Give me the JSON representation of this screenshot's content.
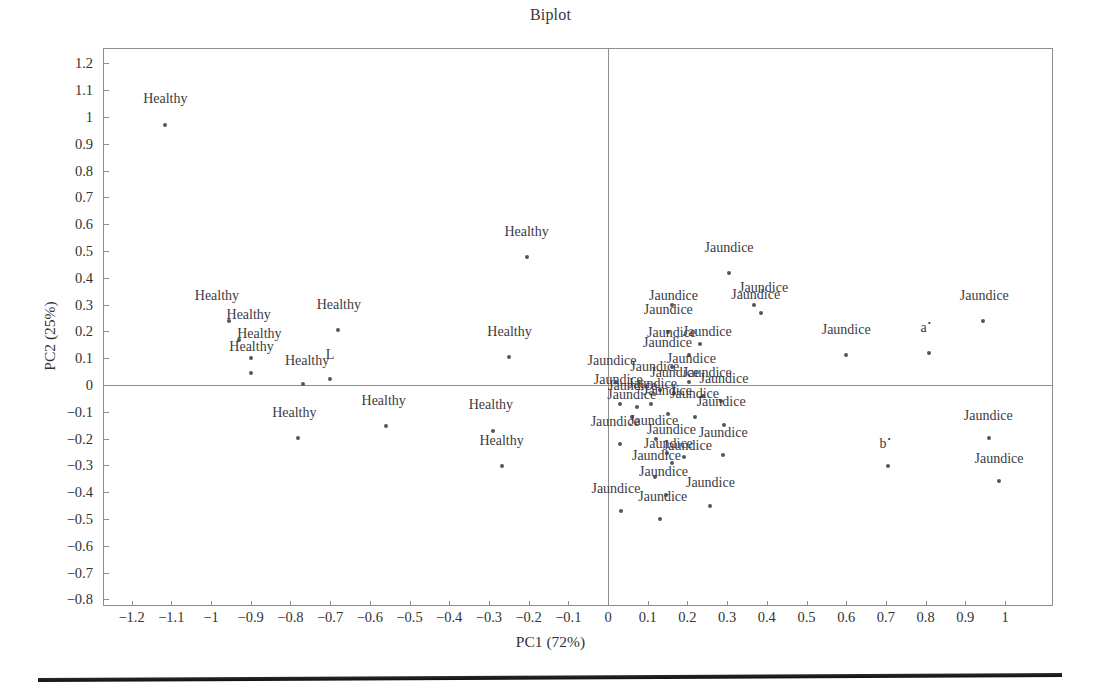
{
  "chart_data": {
    "type": "scatter",
    "title": "Biplot",
    "xlabel": "PC1 (72%)",
    "ylabel": "PC2 (25%)",
    "xlim": [
      -1.28,
      1.12
    ],
    "ylim": [
      -0.86,
      1.28
    ],
    "grid": false,
    "legend": "none",
    "xticks": [
      "−1.2",
      "−1.1",
      "−1",
      "−0.9",
      "−0.8",
      "−0.7",
      "−0.6",
      "−0.5",
      "−0.4",
      "−0.3",
      "−0.2",
      "−0.1",
      "0",
      "0.1",
      "0.2",
      "0.3",
      "0.4",
      "0.5",
      "0.6",
      "0.7",
      "0.8",
      "0.9",
      "1"
    ],
    "xtickvals": [
      -1.2,
      -1.1,
      -1.0,
      -0.9,
      -0.8,
      -0.7,
      -0.6,
      -0.5,
      -0.4,
      -0.3,
      -0.2,
      -0.1,
      0,
      0.1,
      0.2,
      0.3,
      0.4,
      0.5,
      0.6,
      0.7,
      0.8,
      0.9,
      1.0
    ],
    "yticks": [
      "1.2",
      "1.1",
      "1",
      "0.9",
      "0.8",
      "0.7",
      "0.6",
      "0.5",
      "0.4",
      "0.3",
      "0.2",
      "0.1",
      "0",
      "−0.1",
      "−0.2",
      "−0.3",
      "−0.4",
      "−0.5",
      "−0.6",
      "−0.7",
      "−0.8"
    ],
    "ytickvals": [
      1.2,
      1.1,
      1.0,
      0.9,
      0.8,
      0.7,
      0.6,
      0.5,
      0.4,
      0.3,
      0.2,
      0.1,
      0,
      -0.1,
      -0.2,
      -0.3,
      -0.4,
      -0.5,
      -0.6,
      -0.7,
      -0.8
    ],
    "point_color": "#55555c",
    "axis_color": "#8e8e8e",
    "points": [
      {
        "label": "Healthy",
        "x": -1.115,
        "y": 0.972,
        "lx": -1.115,
        "ly": 1.035
      },
      {
        "label": "Healthy",
        "x": -0.955,
        "y": 0.24,
        "lx": -0.985,
        "ly": 0.3
      },
      {
        "label": "Healthy",
        "x": -0.93,
        "y": 0.168,
        "lx": -0.905,
        "ly": 0.228
      },
      {
        "label": "Healthy",
        "x": -0.898,
        "y": 0.1,
        "lx": -0.878,
        "ly": 0.158
      },
      {
        "label": "Healthy",
        "x": -0.9,
        "y": 0.045,
        "lx": -0.898,
        "ly": 0.107
      },
      {
        "label": "Healthy",
        "x": -0.768,
        "y": 0.002,
        "lx": -0.758,
        "ly": 0.056
      },
      {
        "label": "L",
        "x": -0.7,
        "y": 0.022,
        "lx": -0.7,
        "ly": 0.08
      },
      {
        "label": "Healthy",
        "x": -0.68,
        "y": 0.205,
        "lx": -0.678,
        "ly": 0.265
      },
      {
        "label": "Healthy",
        "x": -0.782,
        "y": -0.196,
        "lx": -0.79,
        "ly": -0.138
      },
      {
        "label": "Healthy",
        "x": -0.56,
        "y": -0.152,
        "lx": -0.565,
        "ly": -0.092
      },
      {
        "label": "Healthy",
        "x": -0.29,
        "y": -0.17,
        "lx": -0.295,
        "ly": -0.11
      },
      {
        "label": "Healthy",
        "x": -0.268,
        "y": -0.302,
        "lx": -0.268,
        "ly": -0.242
      },
      {
        "label": "Healthy",
        "x": -0.25,
        "y": 0.105,
        "lx": -0.248,
        "ly": 0.165
      },
      {
        "label": "Healthy",
        "x": -0.205,
        "y": 0.478,
        "lx": -0.205,
        "ly": 0.538
      },
      {
        "label": "Jaundice",
        "x": 0.305,
        "y": 0.418,
        "lx": 0.305,
        "ly": 0.478
      },
      {
        "label": "Jaundice",
        "x": 0.385,
        "y": 0.268,
        "lx": 0.392,
        "ly": 0.328
      },
      {
        "label": "Jaundice",
        "x": 0.368,
        "y": 0.3,
        "lx": 0.372,
        "ly": 0.302
      },
      {
        "label": "Jaundice",
        "x": 0.945,
        "y": 0.238,
        "lx": 0.948,
        "ly": 0.298
      },
      {
        "label": "Jaundice",
        "x": 0.6,
        "y": 0.112,
        "lx": 0.6,
        "ly": 0.172
      },
      {
        "label": "a",
        "x": 0.808,
        "y": 0.118,
        "lx": 0.8,
        "ly": 0.178,
        "star": true
      },
      {
        "label": "Jaundice",
        "x": 0.16,
        "y": 0.3,
        "lx": 0.165,
        "ly": 0.3
      },
      {
        "label": "Jaundice",
        "x": 0.15,
        "y": 0.198,
        "lx": 0.152,
        "ly": 0.248
      },
      {
        "label": "Jaundice",
        "x": 0.205,
        "y": 0.112,
        "lx": 0.16,
        "ly": 0.162
      },
      {
        "label": "Jaundice",
        "x": 0.232,
        "y": 0.152,
        "lx": 0.25,
        "ly": 0.165
      },
      {
        "label": "Jaundice",
        "x": 0.162,
        "y": 0.068,
        "lx": 0.15,
        "ly": 0.122
      },
      {
        "label": "Jaundice",
        "x": 0.205,
        "y": 0.012,
        "lx": 0.21,
        "ly": 0.062
      },
      {
        "label": "Jaundice",
        "x": 0.02,
        "y": 0.01,
        "lx": 0.01,
        "ly": 0.056
      },
      {
        "label": "Jaundice",
        "x": 0.13,
        "y": -0.018,
        "lx": 0.118,
        "ly": 0.032
      },
      {
        "label": "Jaundice",
        "x": 0.165,
        "y": -0.03,
        "lx": 0.168,
        "ly": 0.01
      },
      {
        "label": "Jaundice",
        "x": 0.03,
        "y": -0.072,
        "lx": 0.026,
        "ly": -0.016
      },
      {
        "label": "Jaundice",
        "x": 0.072,
        "y": -0.082,
        "lx": 0.062,
        "ly": -0.036
      },
      {
        "label": "Jaundice",
        "x": 0.108,
        "y": -0.07,
        "lx": 0.112,
        "ly": -0.028
      },
      {
        "label": "Jaundice",
        "x": 0.24,
        "y": -0.04,
        "lx": 0.25,
        "ly": 0.01
      },
      {
        "label": "Jaundice",
        "x": 0.285,
        "y": -0.06,
        "lx": 0.292,
        "ly": -0.012
      },
      {
        "label": "Jaundice",
        "x": 0.15,
        "y": -0.108,
        "lx": 0.15,
        "ly": -0.056
      },
      {
        "label": "Jaundice",
        "x": 0.06,
        "y": -0.118,
        "lx": 0.06,
        "ly": -0.07
      },
      {
        "label": "Jaundice",
        "x": 0.218,
        "y": -0.118,
        "lx": 0.218,
        "ly": -0.068
      },
      {
        "label": "Jaundice",
        "x": 0.292,
        "y": -0.148,
        "lx": 0.285,
        "ly": -0.098
      },
      {
        "label": "Jaundice",
        "x": 0.03,
        "y": -0.222,
        "lx": 0.018,
        "ly": -0.172
      },
      {
        "label": "Jaundice",
        "x": 0.12,
        "y": -0.2,
        "lx": 0.115,
        "ly": -0.168
      },
      {
        "label": "Jaundice",
        "x": 0.148,
        "y": -0.252,
        "lx": 0.16,
        "ly": -0.202
      },
      {
        "label": "Jaundice",
        "x": 0.16,
        "y": -0.29,
        "lx": 0.152,
        "ly": -0.252
      },
      {
        "label": "Jaundice",
        "x": 0.192,
        "y": -0.268,
        "lx": 0.2,
        "ly": -0.262
      },
      {
        "label": "Jaundice",
        "x": 0.118,
        "y": -0.345,
        "lx": 0.122,
        "ly": -0.298
      },
      {
        "label": "Jaundice",
        "x": 0.145,
        "y": -0.412,
        "lx": 0.14,
        "ly": -0.36
      },
      {
        "label": "Jaundice",
        "x": 0.13,
        "y": -0.5,
        "lx": 0.138,
        "ly": -0.452
      },
      {
        "label": "Jaundice",
        "x": 0.032,
        "y": -0.472,
        "lx": 0.02,
        "ly": -0.42
      },
      {
        "label": "Jaundice",
        "x": 0.258,
        "y": -0.452,
        "lx": 0.258,
        "ly": -0.4
      },
      {
        "label": "Jaundice",
        "x": 0.29,
        "y": -0.262,
        "lx": 0.29,
        "ly": -0.212
      },
      {
        "label": "Jaundice",
        "x": 0.96,
        "y": -0.198,
        "lx": 0.958,
        "ly": -0.148
      },
      {
        "label": "Jaundice",
        "x": 0.985,
        "y": -0.36,
        "lx": 0.985,
        "ly": -0.308
      },
      {
        "label": "b",
        "x": 0.705,
        "y": -0.302,
        "lx": 0.698,
        "ly": -0.252,
        "star": true
      }
    ]
  },
  "figure": {
    "background": "#ffffff",
    "scan_bar": true
  }
}
